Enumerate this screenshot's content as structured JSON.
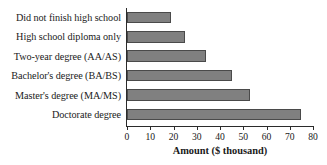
{
  "chart_data": {
    "type": "bar",
    "orientation": "horizontal",
    "title": "",
    "xlabel": "Amount ($ thousand)",
    "ylabel": "",
    "categories": [
      "Did not finish high school",
      "High school diploma only",
      "Two-year degree (AA/AS)",
      "Bachelor's degree (BA/BS)",
      "Master's degree (MA/MS)",
      "Doctorate degree"
    ],
    "values": [
      19,
      25,
      34,
      45,
      53,
      75
    ],
    "xlim": [
      0,
      80
    ],
    "xticks": [
      0,
      10,
      20,
      30,
      40,
      50,
      60,
      70,
      80
    ],
    "xtick_labels": [
      "0",
      "10",
      "20",
      "30",
      "40",
      "50",
      "60",
      "70",
      "80"
    ],
    "grid": false,
    "legend": false,
    "bar_color": "#808080",
    "bar_edge_color": "#4a4a4a",
    "axis_color": "#2b2b2b",
    "background_color": "#ffffff"
  }
}
